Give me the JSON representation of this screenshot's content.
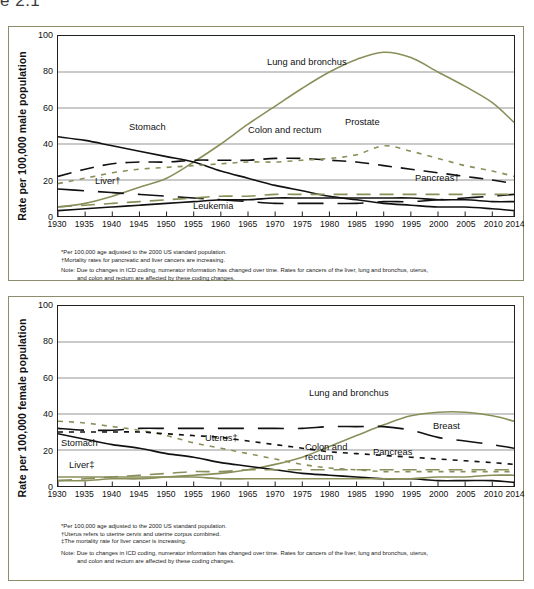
{
  "header_fragment": "e 2.1",
  "colors": {
    "panel_border": "#8d8d6c",
    "axis": "#231f20",
    "gridline": "#b9b9b9",
    "olive": "#8a8f5a",
    "black": "#111111"
  },
  "charts": [
    {
      "id": "male",
      "ylabel": "Rate per 100,000 male population",
      "footnotes": [
        "*Per 100,000 age adjusted to the 2000 US standard population.",
        "†Mortality rates for pancreatic and liver cancers are increasing."
      ],
      "note_line1": "Note: Due to changes in ICD coding, numerator information has changed over time. Rates for cancers of the liver, lung and bronchus, uterus,",
      "note_line2": "and colon and rectum are affected by these coding changes.",
      "annotations": [
        {
          "name": "lung-and-bronchus",
          "text": "Lung and bronchus"
        },
        {
          "name": "stomach",
          "text": "Stomach"
        },
        {
          "name": "colon-and-rectum",
          "text": "Colon and rectum"
        },
        {
          "name": "prostate",
          "text": "Prostate"
        },
        {
          "name": "liver",
          "text": "Liver†"
        },
        {
          "name": "leukemia",
          "text": "Leukemia"
        },
        {
          "name": "pancreas",
          "text": "Pancreas†"
        }
      ]
    },
    {
      "id": "female",
      "ylabel": "Rate per 100,000 female population",
      "footnotes": [
        "*Per 100,000 age adjusted to the 2000 US standard population.",
        "†Uterus refers to uterine cervix and uterine corpus combined.",
        "‡The mortality rate for liver cancer is increasing."
      ],
      "note_line1": "Note: Due to changes in ICD coding, numerator information has changed over time. Rates for cancers of the liver, lung and bronchus, uterus,",
      "note_line2": "and colon and rectum are affected by these coding changes.",
      "annotations": [
        {
          "name": "lung-and-bronchus",
          "text": "Lung and bronchus"
        },
        {
          "name": "breast",
          "text": "Breast"
        },
        {
          "name": "stomach",
          "text": "Stomach"
        },
        {
          "name": "uterus",
          "text": "Uterus‡"
        },
        {
          "name": "colon-and-rectum-1",
          "text": "Colon and"
        },
        {
          "name": "colon-and-rectum-2",
          "text": "rectum"
        },
        {
          "name": "pancreas",
          "text": "Pancreas"
        },
        {
          "name": "liver",
          "text": "Liver‡"
        }
      ]
    }
  ],
  "chart_data": [
    {
      "type": "line",
      "id": "male-cancer-death-rates",
      "title": "",
      "xlabel": "",
      "ylabel": "Rate per 100,000 male population",
      "xlim": [
        1930,
        2014
      ],
      "ylim": [
        0,
        100
      ],
      "yticks": [
        0,
        20,
        40,
        60,
        80,
        100
      ],
      "xticks": [
        1930,
        1935,
        1940,
        1945,
        1950,
        1955,
        1960,
        1965,
        1970,
        1975,
        1980,
        1985,
        1990,
        1995,
        2000,
        2005,
        2010,
        2014
      ],
      "grid": "horizontal",
      "legend": "inline-annotations",
      "x": [
        1930,
        1935,
        1940,
        1945,
        1950,
        1955,
        1960,
        1965,
        1970,
        1975,
        1980,
        1985,
        1990,
        1995,
        2000,
        2005,
        2010,
        2014
      ],
      "series": [
        {
          "name": "Lung and bronchus",
          "style": "solid",
          "color": "#8a8f5a",
          "values": [
            5,
            7,
            11,
            16,
            21,
            30,
            40,
            51,
            61,
            71,
            80,
            87,
            91,
            88,
            80,
            72,
            63,
            52
          ]
        },
        {
          "name": "Stomach",
          "style": "solid",
          "color": "#111111",
          "values": [
            44,
            42,
            39,
            36,
            33,
            30,
            25,
            21,
            17,
            14,
            11,
            9,
            7,
            6,
            5,
            5,
            4,
            3
          ]
        },
        {
          "name": "Colon and rectum",
          "style": "dashed",
          "color": "#111111",
          "values": [
            22,
            26,
            29,
            30,
            30,
            31,
            31,
            31,
            32,
            32,
            31,
            30,
            28,
            26,
            24,
            22,
            20,
            18
          ]
        },
        {
          "name": "Prostate",
          "style": "dotted",
          "color": "#8a8f5a",
          "values": [
            18,
            21,
            24,
            26,
            27,
            28,
            29,
            30,
            30,
            31,
            32,
            34,
            39,
            36,
            32,
            28,
            25,
            22
          ]
        },
        {
          "name": "Liver†",
          "style": "dashed-long",
          "color": "#111111",
          "values": [
            15,
            14,
            13,
            12,
            11,
            10,
            9,
            8,
            7,
            7,
            7,
            7,
            8,
            8,
            9,
            10,
            11,
            12
          ]
        },
        {
          "name": "Leukemia",
          "style": "solid",
          "color": "#111111",
          "values": [
            3,
            4,
            5,
            6,
            7,
            8,
            9,
            9,
            10,
            10,
            10,
            10,
            10,
            10,
            9,
            9,
            8,
            8
          ]
        },
        {
          "name": "Pancreas†",
          "style": "dashed",
          "color": "#8a8f5a",
          "values": [
            5,
            6,
            7,
            8,
            9,
            10,
            11,
            11,
            12,
            12,
            12,
            12,
            12,
            12,
            12,
            12,
            12,
            12
          ]
        }
      ]
    },
    {
      "type": "line",
      "id": "female-cancer-death-rates",
      "title": "",
      "xlabel": "",
      "ylabel": "Rate per 100,000 female population",
      "xlim": [
        1930,
        2014
      ],
      "ylim": [
        0,
        100
      ],
      "yticks": [
        0,
        20,
        40,
        60,
        80,
        100
      ],
      "xticks": [
        1930,
        1935,
        1940,
        1945,
        1950,
        1955,
        1960,
        1965,
        1970,
        1975,
        1980,
        1985,
        1990,
        1995,
        2000,
        2005,
        2010,
        2014
      ],
      "grid": "horizontal",
      "legend": "inline-annotations",
      "x": [
        1930,
        1935,
        1940,
        1945,
        1950,
        1955,
        1960,
        1965,
        1970,
        1975,
        1980,
        1985,
        1990,
        1995,
        2000,
        2005,
        2010,
        2014
      ],
      "series": [
        {
          "name": "Lung and bronchus",
          "style": "solid",
          "color": "#8a8f5a",
          "values": [
            3,
            3,
            4,
            4,
            5,
            6,
            7,
            9,
            12,
            16,
            22,
            28,
            34,
            39,
            41,
            41,
            39,
            36
          ]
        },
        {
          "name": "Breast",
          "style": "dashed-long",
          "color": "#111111",
          "values": [
            32,
            31,
            31,
            32,
            32,
            32,
            32,
            32,
            32,
            32,
            33,
            33,
            33,
            31,
            27,
            25,
            23,
            21
          ]
        },
        {
          "name": "Stomach",
          "style": "solid",
          "color": "#111111",
          "values": [
            29,
            26,
            23,
            21,
            18,
            16,
            13,
            11,
            9,
            7,
            6,
            5,
            4,
            4,
            3,
            3,
            3,
            2
          ]
        },
        {
          "name": "Uterus‡",
          "style": "dotted",
          "color": "#8a8f5a",
          "values": [
            36,
            35,
            33,
            31,
            28,
            24,
            21,
            18,
            15,
            12,
            10,
            9,
            8,
            8,
            8,
            8,
            8,
            8
          ]
        },
        {
          "name": "Colon and rectum",
          "style": "dotted",
          "color": "#111111",
          "values": [
            30,
            30,
            30,
            30,
            29,
            28,
            27,
            25,
            23,
            21,
            19,
            18,
            17,
            16,
            15,
            14,
            13,
            12
          ]
        },
        {
          "name": "Pancreas",
          "style": "dashed",
          "color": "#8a8f5a",
          "values": [
            3,
            4,
            5,
            6,
            7,
            8,
            8,
            9,
            9,
            9,
            9,
            9,
            9,
            9,
            9,
            9,
            9,
            9
          ]
        },
        {
          "name": "Liver‡",
          "style": "solid",
          "color": "#8a8f5a",
          "values": [
            5,
            5,
            5,
            5,
            5,
            5,
            4,
            4,
            4,
            4,
            4,
            4,
            4,
            4,
            5,
            5,
            6,
            6
          ]
        }
      ]
    }
  ]
}
